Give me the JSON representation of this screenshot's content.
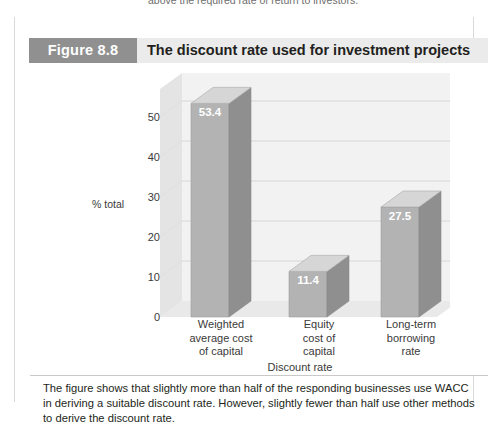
{
  "top_cut_text": "above the required rate of return to investors.",
  "figure": {
    "badge": "Figure 8.8",
    "title": "The discount rate used for investment projects"
  },
  "caption": "The figure shows that slightly more than half of the responding businesses use WACC in deriving a suitable discount rate. However, slightly fewer than half use other methods to derive the discount rate.",
  "colors": {
    "badge_bg": "#909090",
    "header_bg": "#ebebeb",
    "bar_front": "#b3b3b3",
    "bar_side": "#8f8f8f",
    "bar_top": "#d6d6d6",
    "wall_back": "#f2f2f2",
    "wall_left": "#e4e4e4",
    "floor": "#e9e9e9",
    "gridline": "#cfcfcf",
    "value_label": "#ffffff"
  },
  "chart_data": {
    "type": "bar",
    "title": "The discount rate used for investment projects",
    "xlabel": "Discount rate",
    "ylabel": "% total",
    "categories": [
      "Weighted average cost of capital",
      "Equity cost of capital",
      "Long-term borrowing rate"
    ],
    "category_lines": [
      [
        "Weighted",
        "average cost",
        "of capital"
      ],
      [
        "Equity",
        "cost of",
        "capital"
      ],
      [
        "Long-term",
        "borrowing",
        "rate"
      ]
    ],
    "values": [
      53.4,
      11.4,
      27.5
    ],
    "value_labels": [
      "53.4",
      "11.4",
      "27.5"
    ],
    "yticks": [
      0,
      10,
      20,
      30,
      40,
      50
    ],
    "ytick_labels": [
      "0",
      "10",
      "20",
      "30",
      "40",
      "50"
    ],
    "ylim": [
      0,
      57
    ],
    "grid": true,
    "legend": "none",
    "three_d": true
  }
}
